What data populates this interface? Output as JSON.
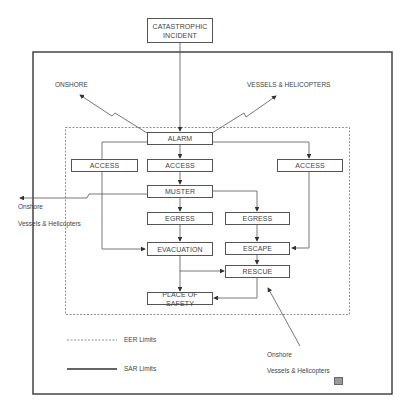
{
  "diagram": {
    "nodes": {
      "incident": "CATASTROPHIC INCIDENT",
      "alarm": "ALARM",
      "access_left": "ACCESS",
      "access_center": "ACCESS",
      "access_right": "ACCESS",
      "muster": "MUSTER",
      "egress_left": "EGRESS",
      "egress_right": "EGRESS",
      "evacuation": "EVACUATION",
      "escape": "ESCAPE",
      "rescue": "RESCUE",
      "place_of_safety": "PLACE OF SAFETY"
    },
    "labels": {
      "top_left": "ONSHORE",
      "top_right": "VESSELS & HELICOPTERS",
      "left_onshore": "Onshore",
      "left_vessels": "Vessels & Helicopters",
      "bottom_onshore": "Onshore",
      "bottom_vessels": "Vessels & Helicopters"
    },
    "legend": {
      "eer": "EER Limits",
      "sar": "SAR Limits"
    },
    "colors": {
      "line": "#555555",
      "text": "#444444"
    }
  }
}
